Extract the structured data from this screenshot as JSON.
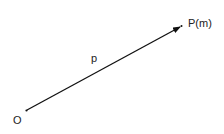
{
  "diagram": {
    "origin_label": "O",
    "point_label": "P(m)",
    "vector_label": "p",
    "line_color": "#111111",
    "text_color": "#222222"
  }
}
